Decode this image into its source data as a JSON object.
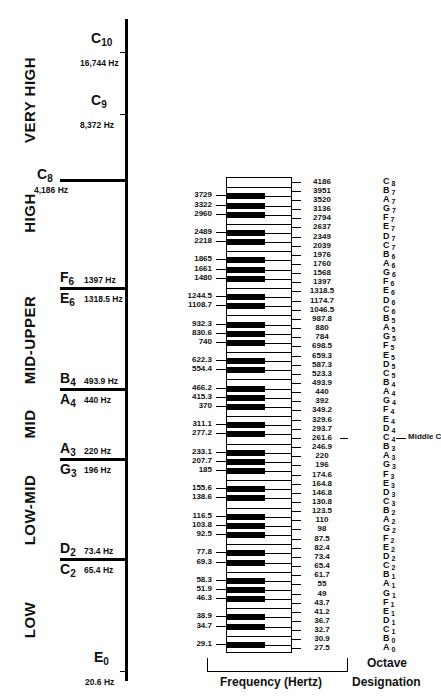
{
  "figure": {
    "axis_notes": [
      {
        "id": "c10",
        "letter": "C",
        "sub": "10",
        "hz": "16,744 Hz",
        "y": 52
      },
      {
        "id": "c9",
        "letter": "C",
        "sub": "9",
        "hz": "8,372 Hz",
        "y": 114
      },
      {
        "id": "c8",
        "letter": "C",
        "sub": "8",
        "hz": "4,186 Hz",
        "y": 180
      },
      {
        "id": "e0",
        "letter": "E",
        "sub": "0",
        "hz": "20.6 Hz",
        "y": 671
      }
    ],
    "band_boundaries": [
      {
        "upper": {
          "letter": "F",
          "sub": "6",
          "hz": "1397 Hz"
        },
        "lower": {
          "letter": "E",
          "sub": "6",
          "hz": "1318.5 Hz"
        },
        "y": 288
      },
      {
        "upper": {
          "letter": "B",
          "sub": "4",
          "hz": "493.9 Hz"
        },
        "lower": {
          "letter": "A",
          "sub": "4",
          "hz": "440 Hz"
        },
        "y": 389
      },
      {
        "upper": {
          "letter": "A",
          "sub": "3",
          "hz": "220 Hz"
        },
        "lower": {
          "letter": "G",
          "sub": "3",
          "hz": "196 Hz"
        },
        "y": 459
      },
      {
        "upper": {
          "letter": "D",
          "sub": "2",
          "hz": "73.4 Hz"
        },
        "lower": {
          "letter": "C",
          "sub": "2",
          "hz": "65.4 Hz"
        },
        "y": 559
      }
    ],
    "bands": [
      {
        "label": "VERY HIGH",
        "y": 100
      },
      {
        "label": "HIGH",
        "y": 213
      },
      {
        "label": "MID-UPPER",
        "y": 340
      },
      {
        "label": "MID",
        "y": 424
      },
      {
        "label": "LOW-MID",
        "y": 510
      },
      {
        "label": "LOW",
        "y": 620
      }
    ],
    "white_keys_top_to_bottom": [
      {
        "freq": "4186",
        "note": "C",
        "octave": "8"
      },
      {
        "freq": "3951",
        "note": "B",
        "octave": "7"
      },
      {
        "freq": "3520",
        "note": "A",
        "octave": "7"
      },
      {
        "freq": "3136",
        "note": "G",
        "octave": "7"
      },
      {
        "freq": "2794",
        "note": "F",
        "octave": "7"
      },
      {
        "freq": "2637",
        "note": "E",
        "octave": "7"
      },
      {
        "freq": "2349",
        "note": "D",
        "octave": "7"
      },
      {
        "freq": "2039",
        "note": "C",
        "octave": "7"
      },
      {
        "freq": "1976",
        "note": "B",
        "octave": "6"
      },
      {
        "freq": "1760",
        "note": "A",
        "octave": "6"
      },
      {
        "freq": "1568",
        "note": "G",
        "octave": "6"
      },
      {
        "freq": "1397",
        "note": "F",
        "octave": "6"
      },
      {
        "freq": "1318.5",
        "note": "E",
        "octave": "6"
      },
      {
        "freq": "1174.7",
        "note": "D",
        "octave": "6"
      },
      {
        "freq": "1046.5",
        "note": "C",
        "octave": "6"
      },
      {
        "freq": "987.8",
        "note": "B",
        "octave": "5"
      },
      {
        "freq": "880",
        "note": "A",
        "octave": "5"
      },
      {
        "freq": "784",
        "note": "G",
        "octave": "5"
      },
      {
        "freq": "698.5",
        "note": "F",
        "octave": "5"
      },
      {
        "freq": "659.3",
        "note": "E",
        "octave": "5"
      },
      {
        "freq": "587.3",
        "note": "D",
        "octave": "5"
      },
      {
        "freq": "523.3",
        "note": "C",
        "octave": "5"
      },
      {
        "freq": "493.9",
        "note": "B",
        "octave": "4"
      },
      {
        "freq": "440",
        "note": "A",
        "octave": "4"
      },
      {
        "freq": "392",
        "note": "G",
        "octave": "4"
      },
      {
        "freq": "349.2",
        "note": "F",
        "octave": "4"
      },
      {
        "freq": "329.6",
        "note": "E",
        "octave": "4"
      },
      {
        "freq": "293.7",
        "note": "D",
        "octave": "4"
      },
      {
        "freq": "261.6",
        "note": "C",
        "octave": "4",
        "annotation": "Middle C"
      },
      {
        "freq": "246.9",
        "note": "B",
        "octave": "3"
      },
      {
        "freq": "220",
        "note": "A",
        "octave": "3"
      },
      {
        "freq": "196",
        "note": "G",
        "octave": "3"
      },
      {
        "freq": "174.6",
        "note": "F",
        "octave": "3"
      },
      {
        "freq": "164.8",
        "note": "E",
        "octave": "3"
      },
      {
        "freq": "146.8",
        "note": "D",
        "octave": "3"
      },
      {
        "freq": "130.8",
        "note": "C",
        "octave": "3"
      },
      {
        "freq": "123.5",
        "note": "B",
        "octave": "2"
      },
      {
        "freq": "110",
        "note": "A",
        "octave": "2"
      },
      {
        "freq": "98",
        "note": "G",
        "octave": "2"
      },
      {
        "freq": "87.5",
        "note": "F",
        "octave": "2"
      },
      {
        "freq": "82.4",
        "note": "E",
        "octave": "2"
      },
      {
        "freq": "73.4",
        "note": "D",
        "octave": "2"
      },
      {
        "freq": "65.4",
        "note": "C",
        "octave": "2"
      },
      {
        "freq": "61.7",
        "note": "B",
        "octave": "1"
      },
      {
        "freq": "55",
        "note": "A",
        "octave": "1"
      },
      {
        "freq": "49",
        "note": "G",
        "octave": "1"
      },
      {
        "freq": "43.7",
        "note": "F",
        "octave": "1"
      },
      {
        "freq": "41.2",
        "note": "E",
        "octave": "1"
      },
      {
        "freq": "36.7",
        "note": "D",
        "octave": "1"
      },
      {
        "freq": "32.7",
        "note": "C",
        "octave": "1"
      },
      {
        "freq": "30.9",
        "note": "B",
        "octave": "0"
      },
      {
        "freq": "27.5",
        "note": "A",
        "octave": "0"
      }
    ],
    "black_keys_top_to_bottom": [
      "3729",
      "3322",
      "2960",
      "2489",
      "2218",
      "1865",
      "1661",
      "1480",
      "1244.5",
      "1108.7",
      "932.3",
      "830.6",
      "740",
      "622.3",
      "554.4",
      "466.2",
      "415.3",
      "370",
      "311.1",
      "277.2",
      "233.1",
      "207.7",
      "185",
      "155.6",
      "138.6",
      "116.5",
      "103.8",
      "92.5",
      "77.8",
      "69.3",
      "58.3",
      "51.9",
      "46.3",
      "38.9",
      "34.7",
      "29.1"
    ],
    "captions": {
      "frequency": "Frequency (Hertz)",
      "octave_line1": "Octave",
      "octave_line2": "Designation"
    }
  }
}
